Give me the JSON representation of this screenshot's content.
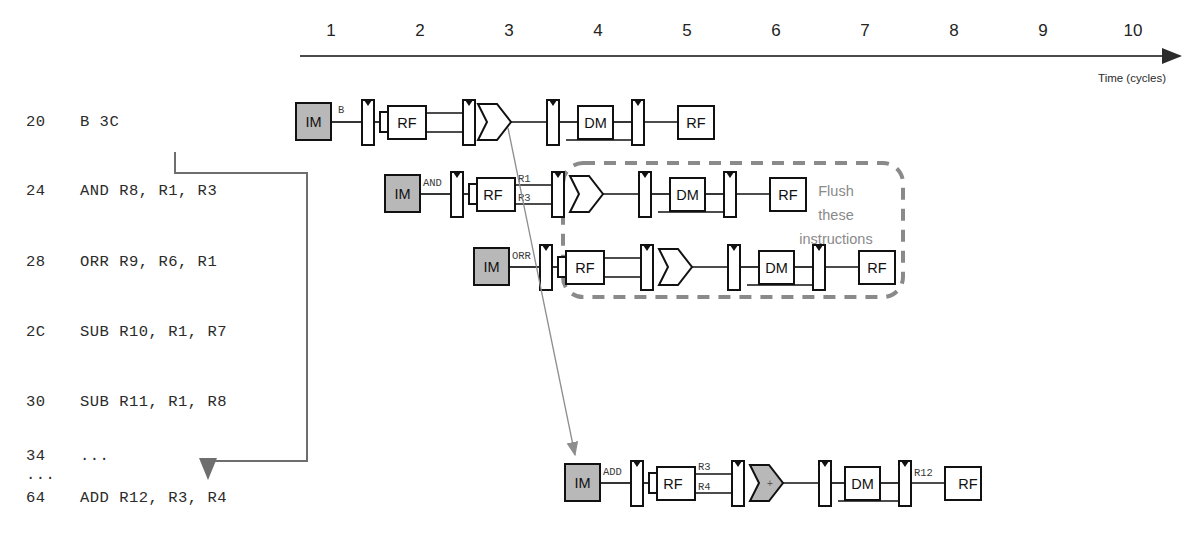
{
  "figure": {
    "axis": {
      "label": "Time (cycles)",
      "cycles": [
        "1",
        "2",
        "3",
        "4",
        "5",
        "6",
        "7",
        "8",
        "9",
        "10"
      ]
    },
    "annotation": {
      "flush_line_1": "Flush",
      "flush_line_2": "these",
      "flush_line_3": "instructions"
    },
    "colors": {
      "shaded_box": "#b8b8b8",
      "outline": "#111111",
      "annotation_gray": "#8a8a8a",
      "flow_gray": "#6e6e6e",
      "background": "#ffffff"
    }
  },
  "program": {
    "instructions": [
      {
        "address": "20",
        "text": "B 3C"
      },
      {
        "address": "24",
        "text": "AND R8, R1, R3"
      },
      {
        "address": "28",
        "text": "ORR R9, R6, R1"
      },
      {
        "address": "2C",
        "text": "SUB R10, R1, R7"
      },
      {
        "address": "30",
        "text": "SUB R11, R1, R8"
      },
      {
        "address": "34",
        "text": "..."
      },
      {
        "address": "...",
        "text": ""
      },
      {
        "address": "64",
        "text": "ADD R12, R3, R4"
      }
    ]
  },
  "pipeline_rows": [
    {
      "name": "row-branch",
      "instruction_label": "B",
      "stages": [
        "IM",
        "RF",
        "ALU",
        "DM",
        "RF"
      ],
      "wire_labels": [],
      "shaded": [
        "IM"
      ],
      "alu_op": ""
    },
    {
      "name": "row-and",
      "instruction_label": "AND",
      "stages": [
        "IM",
        "RF",
        "ALU",
        "DM",
        "RF"
      ],
      "wire_labels": [
        "R1",
        "R3"
      ],
      "shaded": [
        "IM",
        "RF-right"
      ],
      "alu_op": ""
    },
    {
      "name": "row-orr",
      "instruction_label": "ORR",
      "stages": [
        "IM",
        "RF",
        "ALU",
        "DM",
        "RF"
      ],
      "wire_labels": [],
      "shaded": [
        "IM"
      ],
      "alu_op": ""
    },
    {
      "name": "row-add",
      "instruction_label": "ADD",
      "stages": [
        "IM",
        "RF",
        "ALU",
        "DM",
        "RF"
      ],
      "wire_labels": [
        "R3",
        "R4",
        "R12"
      ],
      "shaded": [
        "IM",
        "RF-right",
        "ALU",
        "RF-left"
      ],
      "alu_op": "+"
    }
  ]
}
